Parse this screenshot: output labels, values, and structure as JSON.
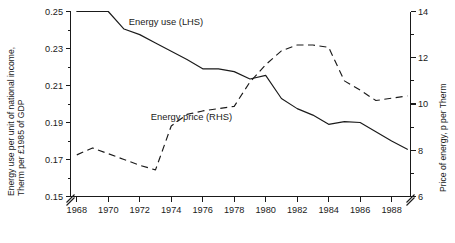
{
  "chart_data": {
    "type": "line",
    "title": "",
    "subtitle": "",
    "xlabel": "",
    "ylabel": "Energy use per unit of national income,\nTherm per £1985 of GDP",
    "ylabel_line1": "Energy use per unit of national income,",
    "ylabel_line2": "Therm per £1985 of GDP",
    "y2label": "Price of energy, p per Therm",
    "grid": false,
    "legend_position": "inline-annotations",
    "x": [
      1968,
      1969,
      1970,
      1971,
      1972,
      1973,
      1974,
      1975,
      1976,
      1977,
      1978,
      1979,
      1980,
      1981,
      1982,
      1983,
      1984,
      1985,
      1986,
      1987,
      1988,
      1989
    ],
    "xlim": [
      1967.6,
      1989.2
    ],
    "xticks": [
      1968,
      1970,
      1972,
      1974,
      1976,
      1978,
      1980,
      1982,
      1984,
      1986,
      1988
    ],
    "xticklabels": [
      "1968",
      "1970",
      "1972",
      "1974",
      "1976",
      "1978",
      "1980",
      "1982",
      "1984",
      "1986",
      "1988"
    ],
    "xminorticks": [
      1969,
      1971,
      1973,
      1975,
      1977,
      1979,
      1981,
      1983,
      1985,
      1987,
      1989
    ],
    "ylim": [
      0.15,
      0.25
    ],
    "yticks": [
      0.15,
      0.17,
      0.19,
      0.21,
      0.23,
      0.25
    ],
    "yticklabels": [
      "0.15",
      "0.17",
      "0.19",
      "0.21",
      "0.23",
      "0.25"
    ],
    "yminorticks": [
      0.16,
      0.18,
      0.2,
      0.22,
      0.24
    ],
    "y_axis_break": true,
    "y2lim": [
      6,
      14
    ],
    "y2ticks": [
      6,
      8,
      10,
      12,
      14
    ],
    "y2ticklabels": [
      "6",
      "8",
      "10",
      "12",
      "14"
    ],
    "y2minorticks": [
      7,
      9,
      11,
      13
    ],
    "y2_axis_break": true,
    "series": [
      {
        "name": "Energy use (LHS)",
        "axis": "left",
        "style": "solid",
        "label_x": 1971.3,
        "label_y": 0.2425,
        "values": [
          0.25,
          0.25,
          0.25,
          0.2405,
          0.2375,
          0.233,
          0.2285,
          0.224,
          0.219,
          0.219,
          0.2175,
          0.2135,
          0.2155,
          0.203,
          0.1975,
          0.194,
          0.189,
          0.1905,
          0.19,
          0.185,
          0.18,
          0.1755
        ]
      },
      {
        "name": "Energy price (RHS)",
        "axis": "right",
        "style": "dashed",
        "label_x": 1972.7,
        "label_y": 0.1915,
        "values": [
          7.8,
          8.1,
          7.85,
          7.6,
          7.35,
          7.15,
          9.05,
          9.55,
          9.7,
          9.8,
          9.9,
          10.95,
          11.7,
          12.3,
          12.55,
          12.55,
          12.45,
          11.0,
          10.6,
          10.15,
          10.25,
          10.35
        ]
      }
    ],
    "annotations": [
      {
        "text": "Energy use (LHS)"
      },
      {
        "text": "Energy price (RHS)"
      }
    ]
  }
}
